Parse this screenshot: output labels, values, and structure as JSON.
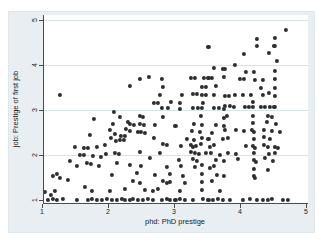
{
  "figure": {
    "kind": "stata-style scatter plot",
    "background_color": "#e8eef1",
    "plot_background": "#ffffff",
    "gridline_color": "#d9e4e8",
    "axis_color": "#4a4a4a",
    "marker_color": "#2e2e2e",
    "text_color": "#222222"
  },
  "chart_data": {
    "type": "scatter",
    "title": "",
    "xlabel": "phd: PhD prestige",
    "ylabel": "job: Prestige of first job",
    "x_ticks": [
      1,
      2,
      3,
      4,
      5
    ],
    "y_ticks": [
      1,
      2,
      3,
      4,
      5
    ],
    "xlim": [
      0.95,
      5.15
    ],
    "ylim": [
      0.93,
      5.1
    ],
    "grid": "horizontal gridlines at y=2,3,4,5",
    "legend": "none",
    "marker": "filled circle, dark gray, jittered",
    "points": [
      [
        1.09,
        1.0
      ],
      [
        1.17,
        1.02
      ],
      [
        1.23,
        1.0
      ],
      [
        1.32,
        1.02
      ],
      [
        1.53,
        1.0
      ],
      [
        1.7,
        1.0
      ],
      [
        1.76,
        1.02
      ],
      [
        1.83,
        1.0
      ],
      [
        1.91,
        1.0
      ],
      [
        1.98,
        1.02
      ],
      [
        2.06,
        1.0
      ],
      [
        2.14,
        1.0
      ],
      [
        2.21,
        1.02
      ],
      [
        2.26,
        1.0
      ],
      [
        2.33,
        1.0
      ],
      [
        2.38,
        1.02
      ],
      [
        2.45,
        1.0
      ],
      [
        2.53,
        1.0
      ],
      [
        2.61,
        1.02
      ],
      [
        2.68,
        1.0
      ],
      [
        2.82,
        1.0
      ],
      [
        2.89,
        1.02
      ],
      [
        2.94,
        1.0
      ],
      [
        3.02,
        1.0
      ],
      [
        3.09,
        1.02
      ],
      [
        3.17,
        1.0
      ],
      [
        3.29,
        1.0
      ],
      [
        3.44,
        1.02
      ],
      [
        3.52,
        1.0
      ],
      [
        3.59,
        1.0
      ],
      [
        3.67,
        1.02
      ],
      [
        3.74,
        1.0
      ],
      [
        3.85,
        1.0
      ],
      [
        4.05,
        1.0
      ],
      [
        4.15,
        1.02
      ],
      [
        4.26,
        1.0
      ],
      [
        4.35,
        1.0
      ],
      [
        4.42,
        1.0
      ],
      [
        4.48,
        1.02
      ],
      [
        4.65,
        1.0
      ],
      [
        4.73,
        1.0
      ],
      [
        1.05,
        1.18
      ],
      [
        1.14,
        1.11
      ],
      [
        1.2,
        1.2
      ],
      [
        1.65,
        1.29
      ],
      [
        1.76,
        1.2
      ],
      [
        2.03,
        1.2
      ],
      [
        2.26,
        1.24
      ],
      [
        1.17,
        1.53
      ],
      [
        1.23,
        1.58
      ],
      [
        1.27,
        1.49
      ],
      [
        1.39,
        1.44
      ],
      [
        1.42,
        1.87
      ],
      [
        1.53,
        1.76
      ],
      [
        1.5,
        2.18
      ],
      [
        1.58,
        2.0
      ],
      [
        1.64,
        2.0
      ],
      [
        1.64,
        2.16
      ],
      [
        1.7,
        2.16
      ],
      [
        1.68,
        1.82
      ],
      [
        1.74,
        1.8
      ],
      [
        1.73,
        2.44
      ],
      [
        1.77,
        1.98
      ],
      [
        1.79,
        2.8
      ],
      [
        1.83,
        2.18
      ],
      [
        1.86,
        1.76
      ],
      [
        1.89,
        1.96
      ],
      [
        1.95,
        2.22
      ],
      [
        1.97,
        2.02
      ],
      [
        2.03,
        2.56
      ],
      [
        2.05,
        2.38
      ],
      [
        2.06,
        1.56
      ],
      [
        2.08,
        2.69
      ],
      [
        2.09,
        2.96
      ],
      [
        2.11,
        2.04
      ],
      [
        2.11,
        2.47
      ],
      [
        2.12,
        2.31
      ],
      [
        2.14,
        1.82
      ],
      [
        2.17,
        2.02
      ],
      [
        2.18,
        2.33
      ],
      [
        2.18,
        2.84
      ],
      [
        2.2,
        2.42
      ],
      [
        2.24,
        2.33
      ],
      [
        2.26,
        2.42
      ],
      [
        2.27,
        2.58
      ],
      [
        2.3,
        2.73
      ],
      [
        1.27,
        3.33
      ],
      [
        2.33,
        1.78
      ],
      [
        2.38,
        1.42
      ],
      [
        2.44,
        1.6
      ],
      [
        2.48,
        1.38
      ],
      [
        2.48,
        2.07
      ],
      [
        2.5,
        1.76
      ],
      [
        2.56,
        1.22
      ],
      [
        2.64,
        1.93
      ],
      [
        2.68,
        1.2
      ],
      [
        2.71,
        1.56
      ],
      [
        2.76,
        1.24
      ],
      [
        2.79,
        2.04
      ],
      [
        2.83,
        1.42
      ],
      [
        2.89,
        1.38
      ],
      [
        2.94,
        1.4
      ],
      [
        2.94,
        1.58
      ],
      [
        2.89,
        1.73
      ],
      [
        3.08,
        1.89
      ],
      [
        3.09,
        1.2
      ],
      [
        3.11,
        1.76
      ],
      [
        3.14,
        1.53
      ],
      [
        3.17,
        1.38
      ],
      [
        3.26,
        2.07
      ],
      [
        3.29,
        1.91
      ],
      [
        3.32,
        1.73
      ],
      [
        3.32,
        2.04
      ],
      [
        3.35,
        1.87
      ],
      [
        3.38,
        2.02
      ],
      [
        3.42,
        1.22
      ],
      [
        3.42,
        1.4
      ],
      [
        3.42,
        1.58
      ],
      [
        3.42,
        1.78
      ],
      [
        3.48,
        2.04
      ],
      [
        3.55,
        1.71
      ],
      [
        3.56,
        2.04
      ],
      [
        3.58,
        1.42
      ],
      [
        3.61,
        1.76
      ],
      [
        3.64,
        1.89
      ],
      [
        3.65,
        1.56
      ],
      [
        3.7,
        1.2
      ],
      [
        3.7,
        2.0
      ],
      [
        3.76,
        1.53
      ],
      [
        3.76,
        1.87
      ],
      [
        2.33,
        2.53
      ],
      [
        2.33,
        2.69
      ],
      [
        2.39,
        2.67
      ],
      [
        2.45,
        2.51
      ],
      [
        2.48,
        2.69
      ],
      [
        2.48,
        2.87
      ],
      [
        2.5,
        2.51
      ],
      [
        2.53,
        2.84
      ],
      [
        2.55,
        2.67
      ],
      [
        2.56,
        2.49
      ],
      [
        2.7,
        2.38
      ],
      [
        2.71,
        2.67
      ],
      [
        2.83,
        2.24
      ],
      [
        2.89,
        2.22
      ],
      [
        2.83,
        2.84
      ],
      [
        2.82,
        3.04
      ],
      [
        2.91,
        3.04
      ],
      [
        3.02,
        2.64
      ],
      [
        3.09,
        3.02
      ],
      [
        3.11,
        2.2
      ],
      [
        3.2,
        2.36
      ],
      [
        3.26,
        2.22
      ],
      [
        3.27,
        2.53
      ],
      [
        3.29,
        2.18
      ],
      [
        3.29,
        3.04
      ],
      [
        3.3,
        2.33
      ],
      [
        3.3,
        2.69
      ],
      [
        3.33,
        2.2
      ],
      [
        3.36,
        3.04
      ],
      [
        3.39,
        2.51
      ],
      [
        3.41,
        2.24
      ],
      [
        3.41,
        2.87
      ],
      [
        3.42,
        2.38
      ],
      [
        3.42,
        2.67
      ],
      [
        3.42,
        3.04
      ],
      [
        3.52,
        2.36
      ],
      [
        3.55,
        2.18
      ],
      [
        3.58,
        2.49
      ],
      [
        3.61,
        2.22
      ],
      [
        3.61,
        3.04
      ],
      [
        3.64,
        2.67
      ],
      [
        3.68,
        3.04
      ],
      [
        3.74,
        2.36
      ],
      [
        3.76,
        2.64
      ],
      [
        3.76,
        2.82
      ],
      [
        2.33,
        3.53
      ],
      [
        2.48,
        3.69
      ],
      [
        2.62,
        3.73
      ],
      [
        2.7,
        3.16
      ],
      [
        2.76,
        3.16
      ],
      [
        2.79,
        3.33
      ],
      [
        2.82,
        3.69
      ],
      [
        2.83,
        3.51
      ],
      [
        2.95,
        3.18
      ],
      [
        3.09,
        3.16
      ],
      [
        3.12,
        3.33
      ],
      [
        3.26,
        3.71
      ],
      [
        3.29,
        3.36
      ],
      [
        3.32,
        3.71
      ],
      [
        3.35,
        3.36
      ],
      [
        3.42,
        3.33
      ],
      [
        3.42,
        3.51
      ],
      [
        3.44,
        3.16
      ],
      [
        3.45,
        3.71
      ],
      [
        3.48,
        3.33
      ],
      [
        3.48,
        3.51
      ],
      [
        3.52,
        3.71
      ],
      [
        3.52,
        4.4
      ],
      [
        3.58,
        3.71
      ],
      [
        3.61,
        3.33
      ],
      [
        3.61,
        3.93
      ],
      [
        3.64,
        3.53
      ],
      [
        3.74,
        3.91
      ],
      [
        3.76,
        3.02
      ],
      [
        3.76,
        3.73
      ],
      [
        3.77,
        3.09
      ],
      [
        3.85,
        3.09
      ],
      [
        3.91,
        3.07
      ],
      [
        4.08,
        3.07
      ],
      [
        4.14,
        3.07
      ],
      [
        4.2,
        3.07
      ],
      [
        4.32,
        3.07
      ],
      [
        4.38,
        3.07
      ],
      [
        4.45,
        3.07
      ],
      [
        4.52,
        3.07
      ],
      [
        3.77,
        3.31
      ],
      [
        3.83,
        3.31
      ],
      [
        3.92,
        3.33
      ],
      [
        4.05,
        3.33
      ],
      [
        4.17,
        3.33
      ],
      [
        4.2,
        3.18
      ],
      [
        4.35,
        3.33
      ],
      [
        4.44,
        3.38
      ],
      [
        4.53,
        3.31
      ],
      [
        4.32,
        3.49
      ],
      [
        4.53,
        3.49
      ],
      [
        4.0,
        3.69
      ],
      [
        4.06,
        3.69
      ],
      [
        4.23,
        3.67
      ],
      [
        4.35,
        3.67
      ],
      [
        4.53,
        3.69
      ],
      [
        3.77,
        3.91
      ],
      [
        3.92,
        4.0
      ],
      [
        4.09,
        3.84
      ],
      [
        4.21,
        3.84
      ],
      [
        4.53,
        3.87
      ],
      [
        4.06,
        4.24
      ],
      [
        4.44,
        4.27
      ],
      [
        4.56,
        4.09
      ],
      [
        4.26,
        4.42
      ],
      [
        4.52,
        4.42
      ],
      [
        4.26,
        4.58
      ],
      [
        4.53,
        4.6
      ],
      [
        4.7,
        4.78
      ],
      [
        3.8,
        2.87
      ],
      [
        4.2,
        2.87
      ],
      [
        4.42,
        2.87
      ],
      [
        4.48,
        2.84
      ],
      [
        4.2,
        2.71
      ],
      [
        4.41,
        2.73
      ],
      [
        4.55,
        2.69
      ],
      [
        3.77,
        2.56
      ],
      [
        3.94,
        2.56
      ],
      [
        4.06,
        2.53
      ],
      [
        4.18,
        2.56
      ],
      [
        4.21,
        2.51
      ],
      [
        4.36,
        2.56
      ],
      [
        4.48,
        2.53
      ],
      [
        4.61,
        2.51
      ],
      [
        3.82,
        2.38
      ],
      [
        4.21,
        2.36
      ],
      [
        4.36,
        2.4
      ],
      [
        4.45,
        2.36
      ],
      [
        4.09,
        2.2
      ],
      [
        4.2,
        2.2
      ],
      [
        4.23,
        2.16
      ],
      [
        4.36,
        2.22
      ],
      [
        4.42,
        2.18
      ],
      [
        4.53,
        2.18
      ],
      [
        4.58,
        2.16
      ],
      [
        3.82,
        2.04
      ],
      [
        3.94,
        2.02
      ],
      [
        4.21,
        2.04
      ],
      [
        4.44,
        2.02
      ],
      [
        4.53,
        2.04
      ],
      [
        3.97,
        1.91
      ],
      [
        4.21,
        1.89
      ],
      [
        4.24,
        1.84
      ],
      [
        4.38,
        1.93
      ],
      [
        4.5,
        1.87
      ],
      [
        4.21,
        1.69
      ],
      [
        4.42,
        1.67
      ],
      [
        4.21,
        1.53
      ],
      [
        4.23,
        1.49
      ]
    ]
  }
}
